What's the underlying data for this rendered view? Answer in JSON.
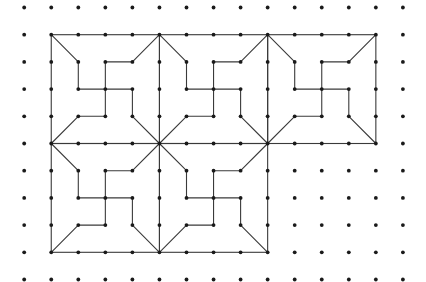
{
  "diagram": {
    "type": "dot-grid-tiling",
    "grid": {
      "columns": 15,
      "rows": 11,
      "origin_x": 24.2,
      "origin_y": 7.5,
      "spacing_x": 27.05,
      "spacing_y": 27.2,
      "dot_radius": 1.9
    },
    "colors": {
      "background": "#ffffff",
      "dot": "#1a1a1a",
      "line": "#3a3a3a"
    },
    "tile_size": 4,
    "tiles": [
      {
        "id": "tile-top-left",
        "col": 1,
        "row": 1
      },
      {
        "id": "tile-top-middle",
        "col": 5,
        "row": 1
      },
      {
        "id": "tile-top-right",
        "col": 9,
        "row": 1
      },
      {
        "id": "tile-bottom-left",
        "col": 1,
        "row": 5
      },
      {
        "id": "tile-bottom-middle",
        "col": 5,
        "row": 5
      }
    ],
    "tile_pattern_edges": [
      [
        [
          0,
          0
        ],
        [
          1,
          1
        ]
      ],
      [
        [
          1,
          1
        ],
        [
          1,
          2
        ]
      ],
      [
        [
          1,
          2
        ],
        [
          2,
          2
        ]
      ],
      [
        [
          2,
          2
        ],
        [
          2,
          1
        ]
      ],
      [
        [
          2,
          1
        ],
        [
          3,
          1
        ]
      ],
      [
        [
          3,
          1
        ],
        [
          4,
          0
        ]
      ],
      [
        [
          2,
          2
        ],
        [
          3,
          2
        ]
      ],
      [
        [
          3,
          2
        ],
        [
          3,
          3
        ]
      ],
      [
        [
          3,
          3
        ],
        [
          4,
          4
        ]
      ],
      [
        [
          2,
          2
        ],
        [
          2,
          3
        ]
      ],
      [
        [
          2,
          3
        ],
        [
          1,
          3
        ]
      ],
      [
        [
          1,
          3
        ],
        [
          0,
          4
        ]
      ]
    ]
  }
}
